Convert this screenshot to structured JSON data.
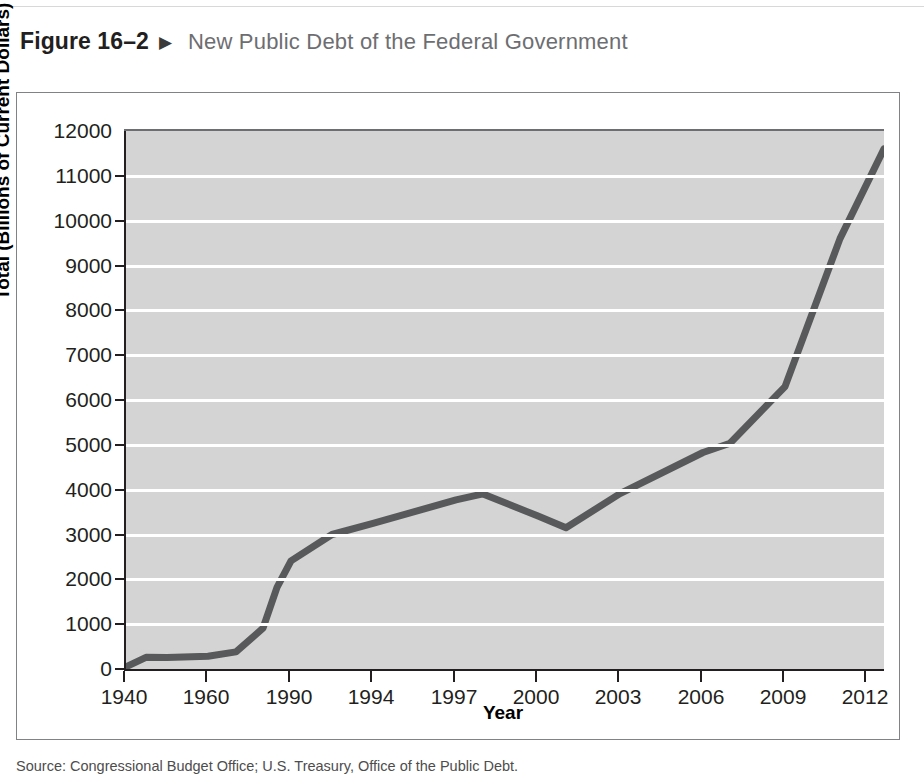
{
  "figure": {
    "number": "Figure 16–2",
    "arrow": "▶",
    "title": "New Public Debt of the Federal Government",
    "source": "Source: Congressional Budget Office; U.S. Treasury, Office of the Public Debt."
  },
  "colors": {
    "plot_background": "#d4d4d4",
    "gridline": "#ffffff",
    "series_line": "#58595b",
    "axis": "#231f20",
    "frame": "#808285",
    "title_text": "#6d6e71",
    "number_text": "#231f20"
  },
  "chart_data": {
    "type": "line",
    "title": "New Public Debt of the Federal Government",
    "xlabel": "Year",
    "ylabel": "Total (Billions of Current Dollars)",
    "ylim": [
      0,
      12000
    ],
    "ytick_labels": [
      "0",
      "1000",
      "2000",
      "3000",
      "4000",
      "5000",
      "6000",
      "7000",
      "8000",
      "9000",
      "10000",
      "11000",
      "12000"
    ],
    "ytick_values": [
      0,
      1000,
      2000,
      3000,
      4000,
      5000,
      6000,
      7000,
      8000,
      9000,
      10000,
      11000,
      12000
    ],
    "xtick_labels": [
      "1940",
      "1960",
      "1990",
      "1994",
      "1997",
      "2000",
      "2003",
      "2006",
      "2009",
      "2012"
    ],
    "xtick_positions": [
      0,
      82,
      165,
      247,
      330,
      412,
      494,
      577,
      659,
      741
    ],
    "grid": "horizontal",
    "legend": "none",
    "series": [
      {
        "name": "Total public debt",
        "points": [
          {
            "label": "1940",
            "pos": 0,
            "value": 50
          },
          {
            "label": "1945",
            "pos": 20,
            "value": 260
          },
          {
            "label": "1950",
            "pos": 41,
            "value": 257
          },
          {
            "label": "1960",
            "pos": 82,
            "value": 286
          },
          {
            "label": "1970",
            "pos": 110,
            "value": 381
          },
          {
            "label": "1980",
            "pos": 137,
            "value": 909
          },
          {
            "label": "1985",
            "pos": 151,
            "value": 1823
          },
          {
            "label": "1990",
            "pos": 165,
            "value": 2412
          },
          {
            "label": "1992",
            "pos": 206,
            "value": 3000
          },
          {
            "label": "1994",
            "pos": 247,
            "value": 3248
          },
          {
            "label": "1997",
            "pos": 330,
            "value": 3772
          },
          {
            "label": "1998",
            "pos": 357,
            "value": 3905
          },
          {
            "label": "2000",
            "pos": 412,
            "value": 3410
          },
          {
            "label": "2001",
            "pos": 440,
            "value": 3150
          },
          {
            "label": "2003",
            "pos": 494,
            "value": 3913
          },
          {
            "label": "2006",
            "pos": 577,
            "value": 4829
          },
          {
            "label": "2007",
            "pos": 604,
            "value": 5035
          },
          {
            "label": "2009",
            "pos": 659,
            "value": 6300
          },
          {
            "label": "2011",
            "pos": 714,
            "value": 9600
          },
          {
            "label": "2013",
            "pos": 758,
            "value": 11600
          }
        ]
      }
    ]
  }
}
